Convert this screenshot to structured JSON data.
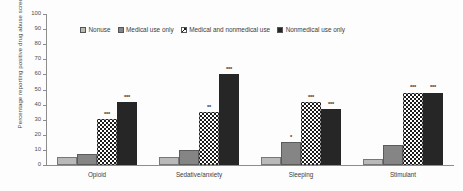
{
  "chart_data": {
    "type": "bar",
    "title": "",
    "xlabel": "",
    "ylabel": "Percentage reporting positive drug abuse screen",
    "ylim": [
      0,
      100
    ],
    "ytick_step": 10,
    "yticks": [
      "100",
      "90",
      "80",
      "70",
      "60",
      "50",
      "40",
      "30",
      "20",
      "10",
      "0"
    ],
    "grid": false,
    "legend_position": "top-center",
    "categories": [
      "Opioid",
      "Sedative/anxiety",
      "Sleeping",
      "Stimulant"
    ],
    "series": [
      {
        "name": "Nonuse",
        "color": "#b9b9b9",
        "pattern": "solid-light-gray",
        "values": [
          5,
          5,
          5,
          4
        ],
        "significance": [
          "",
          "",
          "",
          ""
        ]
      },
      {
        "name": "Medical use only",
        "color": "#858585",
        "pattern": "solid-medium-gray",
        "values": [
          7,
          10,
          15,
          13
        ],
        "significance": [
          "",
          "",
          "*",
          ""
        ]
      },
      {
        "name": "Medical and nonmedical use",
        "color": "#1c1c1c",
        "pattern": "checkerboard",
        "values": [
          30.5,
          35,
          42,
          48
        ],
        "significance": [
          "***",
          "**",
          "***",
          "***"
        ]
      },
      {
        "name": "Nonmedical use only",
        "color": "#262626",
        "pattern": "solid-black",
        "values": [
          41.5,
          60,
          37,
          48
        ],
        "significance": [
          "***",
          "***",
          "***",
          "***"
        ]
      }
    ]
  },
  "axis": {
    "y_title": "Percentage reporting positive drug abuse screen"
  }
}
